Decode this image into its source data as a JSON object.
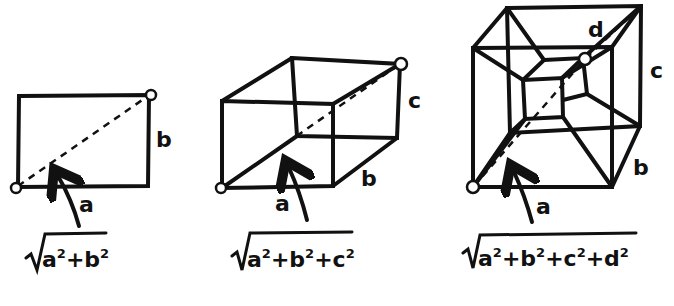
{
  "figures": [
    {
      "name": "rectangle-2d",
      "labels": {
        "a": "a",
        "b": "b"
      },
      "formula": {
        "terms": [
          "a",
          "b"
        ],
        "text": "√(a²+b²)"
      }
    },
    {
      "name": "box-3d",
      "labels": {
        "a": "a",
        "b": "b",
        "c": "c"
      },
      "formula": {
        "terms": [
          "a",
          "b",
          "c"
        ],
        "text": "√(a²+b²+c²)"
      }
    },
    {
      "name": "tesseract-4d",
      "labels": {
        "a": "a",
        "b": "b",
        "c": "c",
        "d": "d"
      },
      "formula": {
        "terms": [
          "a",
          "b",
          "c",
          "d"
        ],
        "text": "√(a²+b²+c²+d²)"
      }
    }
  ],
  "symbols": {
    "plus": "+",
    "sq": "2",
    "radical": "√"
  },
  "colors": {
    "ink": "#111111",
    "background": "#ffffff"
  }
}
